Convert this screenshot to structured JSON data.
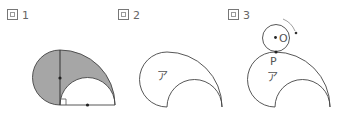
{
  "figures": [
    {
      "label_prefix": "図",
      "label_number": "1",
      "description": "Shaded region bounded by a left semicircle, an outer quarter circle and an inner semicircle; vertical diameter with center dot; base line with center dot and right-angle mark",
      "shade_color": "#a6a6a6"
    },
    {
      "label_prefix": "図",
      "label_number": "2",
      "region_label": "ア"
    },
    {
      "label_prefix": "図",
      "label_number": "3",
      "region_label": "ア",
      "point_label": "P",
      "circle_center_label": "O",
      "rotation_arrow": "clockwise"
    }
  ],
  "colors": {
    "stroke": "#444444",
    "shade": "#a6a6a6",
    "label": "#666666"
  }
}
